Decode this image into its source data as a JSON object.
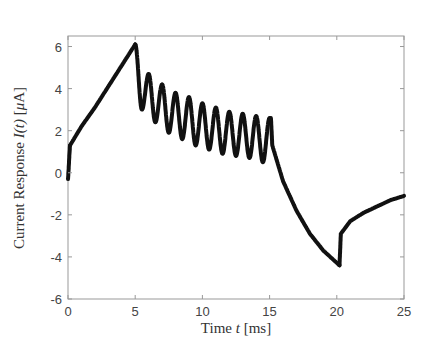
{
  "chart_data": {
    "type": "scatter",
    "title": "",
    "xlabel": "Time t [ms]",
    "ylabel": "Current Response I(t) [μA]",
    "xlim": [
      0,
      25
    ],
    "ylim": [
      -6,
      6.5
    ],
    "xticks": [
      0,
      5,
      10,
      15,
      20,
      25
    ],
    "yticks": [
      -6,
      -4,
      -2,
      0,
      2,
      4,
      6
    ],
    "grid": false,
    "legend": null,
    "marker_color": "#111111",
    "series": [
      {
        "name": "I(t)",
        "segments": [
          {
            "label": "initial jump",
            "x": [
              0.0,
              0.05,
              0.1,
              0.15
            ],
            "y": [
              -0.3,
              0.2,
              0.8,
              1.3
            ]
          },
          {
            "label": "linear ramp up",
            "x": [
              0.15,
              1,
              2,
              3,
              4,
              5
            ],
            "y": [
              1.3,
              2.2,
              3.1,
              4.1,
              5.1,
              6.1
            ]
          },
          {
            "label": "oscillation",
            "x": [
              5.0,
              5.5,
              6.0,
              6.5,
              7.0,
              7.5,
              8.0,
              8.5,
              9.0,
              9.5,
              10.0,
              10.5,
              11.0,
              11.5,
              12.0,
              12.5,
              13.0,
              13.5,
              14.0,
              14.5,
              15.0
            ],
            "y": [
              6.1,
              3.0,
              4.7,
              2.4,
              4.2,
              1.9,
              3.8,
              1.6,
              3.6,
              1.3,
              3.3,
              1.1,
              3.1,
              0.9,
              2.9,
              0.8,
              2.8,
              0.7,
              2.7,
              0.5,
              2.6
            ]
          },
          {
            "label": "drop and decay down",
            "x": [
              15.1,
              15.2,
              16,
              17,
              18,
              19,
              20.2
            ],
            "y": [
              2.6,
              1.3,
              -0.4,
              -1.8,
              -2.9,
              -3.7,
              -4.4
            ]
          },
          {
            "label": "jump and recovery",
            "x": [
              20.2,
              20.3,
              21,
              22,
              23,
              24,
              25
            ],
            "y": [
              -4.4,
              -2.9,
              -2.3,
              -1.9,
              -1.6,
              -1.3,
              -1.1
            ]
          }
        ]
      }
    ]
  }
}
